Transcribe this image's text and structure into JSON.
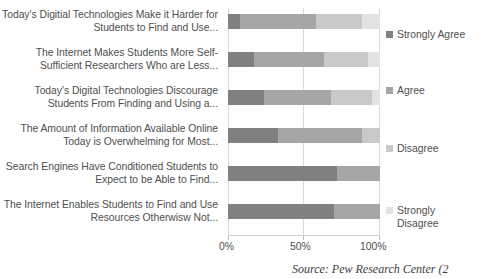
{
  "chart_data": {
    "type": "bar",
    "orientation": "horizontal",
    "stacked": true,
    "normalized_percent": true,
    "title": "",
    "subtitle": "",
    "xlabel": "",
    "ylabel": "",
    "xlim": [
      0,
      100
    ],
    "grid": true,
    "legend_position": "right",
    "xticks": [
      "0%",
      "50%",
      "100%"
    ],
    "xtick_values": [
      0,
      50,
      100
    ],
    "categories": [
      "Today's Digitial Technologies Make it Harder for Students to Find and Use...",
      "The Internet Makes Students More Self-Sufficient Researchers Who are Less...",
      "Today's Digital Technologies  Discourage Students From Finding and Using a...",
      "The Amount of Information Available Online Today is Overwhelming for Most...",
      "Search Engines Have Conditioned Students to Expect to be Able to Find...",
      "The Internet Enables Students to Find and Use Resources Otherwisw Not..."
    ],
    "series": [
      {
        "name": "Strongly Agree",
        "color": "#808080",
        "values": [
          8,
          17,
          24,
          33,
          72,
          70
        ]
      },
      {
        "name": "Agree",
        "color": "#a6a6a6",
        "values": [
          50,
          46,
          44,
          55,
          28,
          30
        ]
      },
      {
        "name": "Disagree",
        "color": "#c9c9c9",
        "values": [
          30,
          29,
          27,
          12,
          0,
          0
        ]
      },
      {
        "name": "Strongly Disagree",
        "color": "#e3e3e3",
        "values": [
          12,
          8,
          5,
          0,
          0,
          0
        ]
      }
    ],
    "source_note": "Source: Pew Research Center (2"
  },
  "legend": {
    "items": [
      {
        "label": "Strongly Agree"
      },
      {
        "label": "Agree"
      },
      {
        "label": "Disagree"
      },
      {
        "label": "Strongly Disagree"
      }
    ]
  }
}
